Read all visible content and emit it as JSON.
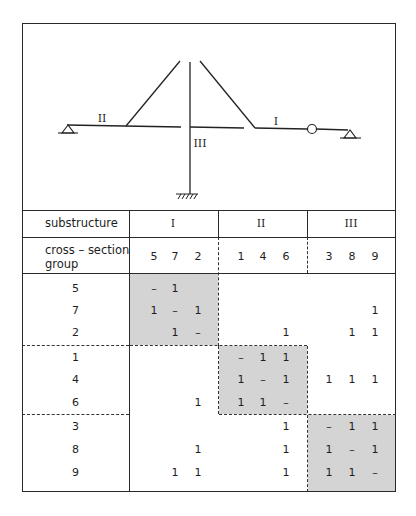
{
  "figure": {
    "labels": {
      "substructure_I": "I",
      "substructure_II": "II",
      "substructure_III": "III"
    }
  },
  "table": {
    "header": {
      "substructure_label": "substructure",
      "cross_section_label_line1": "cross – section",
      "cross_section_label_line2": "group",
      "substructures": [
        {
          "name": "I",
          "groups": [
            "5",
            "7",
            "2"
          ]
        },
        {
          "name": "II",
          "groups": [
            "1",
            "4",
            "6"
          ]
        },
        {
          "name": "III",
          "groups": [
            "3",
            "8",
            "9"
          ]
        }
      ]
    },
    "column_order": [
      "5",
      "7",
      "2",
      "1",
      "4",
      "6",
      "3",
      "8",
      "9"
    ],
    "rows": [
      {
        "label": "5",
        "cells": [
          "–",
          "1",
          "",
          "",
          "",
          "",
          "",
          "",
          ""
        ]
      },
      {
        "label": "7",
        "cells": [
          "1",
          "–",
          "1",
          "",
          "",
          "",
          "",
          "",
          "1"
        ]
      },
      {
        "label": "2",
        "cells": [
          "",
          "1",
          "–",
          "",
          "",
          "1",
          "",
          "1",
          "1"
        ]
      },
      {
        "label": "1",
        "cells": [
          "",
          "",
          "",
          "–",
          "1",
          "1",
          "",
          "",
          ""
        ]
      },
      {
        "label": "4",
        "cells": [
          "",
          "",
          "",
          "1",
          "–",
          "1",
          "1",
          "1",
          "1"
        ]
      },
      {
        "label": "6",
        "cells": [
          "",
          "",
          "1",
          "1",
          "1",
          "–",
          "",
          "",
          ""
        ]
      },
      {
        "label": "3",
        "cells": [
          "",
          "",
          "",
          "",
          "",
          "1",
          "–",
          "1",
          "1"
        ]
      },
      {
        "label": "8",
        "cells": [
          "",
          "",
          "1",
          "",
          "",
          "1",
          "1",
          "–",
          "1"
        ]
      },
      {
        "label": "9",
        "cells": [
          "",
          "1",
          "1",
          "",
          "",
          "1",
          "1",
          "1",
          "–"
        ]
      }
    ]
  },
  "colors": {
    "line": "#2a2a2a",
    "shade": "#d4d4d4",
    "background": "#ffffff"
  }
}
